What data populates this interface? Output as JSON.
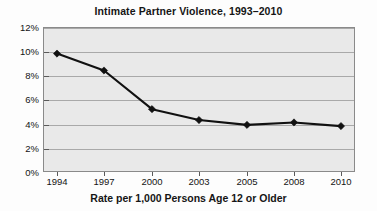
{
  "chart_data": {
    "type": "line",
    "title": "Intimate Partner Violence, 1993–2010",
    "xlabel": "Rate per 1,000 Persons Age 12 or Older",
    "ylabel": "",
    "categories": [
      "1994",
      "1997",
      "2000",
      "2003",
      "2005",
      "2008",
      "2010"
    ],
    "values": [
      9.8,
      8.4,
      5.2,
      4.3,
      3.9,
      4.1,
      3.8
    ],
    "series": [
      {
        "name": "Intimate Partner Violence Rate",
        "values": [
          9.8,
          8.4,
          5.2,
          4.3,
          3.9,
          4.1,
          3.8
        ]
      }
    ],
    "ylim": [
      0,
      12
    ],
    "ytick_values": [
      0,
      2,
      4,
      6,
      8,
      10,
      12
    ],
    "ytick_labels": [
      "0%",
      "2%",
      "4%",
      "6%",
      "8%",
      "10%",
      "12%"
    ],
    "xtick_labels": [
      "1994",
      "1997",
      "2000",
      "2003",
      "2005",
      "2008",
      "2010"
    ],
    "grid": true,
    "legend": false,
    "marker": "diamond",
    "line_color": "#111111",
    "marker_color": "#111111",
    "plot_background": "#e9e9e9",
    "gridline_color": "#a9a9a9",
    "annotations": []
  }
}
